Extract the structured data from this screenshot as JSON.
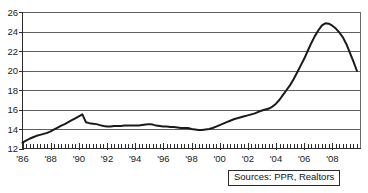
{
  "chart_data": {
    "type": "line",
    "title": "",
    "xlabel": "",
    "ylabel": "",
    "ylim": [
      12,
      26
    ],
    "xlim": [
      1986,
      2010
    ],
    "ytick_step": 2,
    "grid": true,
    "grid_axis": "y",
    "legend": "none",
    "line_color": "#1a1a1a",
    "minor_ticks": "quarterly",
    "yticks": [
      12,
      14,
      16,
      18,
      20,
      22,
      24,
      26
    ],
    "ytick_labels": [
      "12",
      "14",
      "16",
      "18",
      "20",
      "22",
      "24",
      "26"
    ],
    "xticks": [
      1986,
      1988,
      1990,
      1992,
      1994,
      1996,
      1998,
      2000,
      2002,
      2004,
      2006,
      2008
    ],
    "xtick_labels": [
      "'86",
      "'88",
      "'90",
      "'92",
      "'94",
      "'96",
      "'98",
      "'00",
      "'02",
      "'04",
      "'06",
      "'08"
    ],
    "series": [
      {
        "name": "value",
        "x": [
          1986.0,
          1986.25,
          1986.5,
          1986.75,
          1987.0,
          1987.25,
          1987.5,
          1987.75,
          1988.0,
          1988.25,
          1988.5,
          1988.75,
          1989.0,
          1989.25,
          1989.5,
          1989.75,
          1990.0,
          1990.25,
          1990.5,
          1990.75,
          1991.0,
          1991.25,
          1991.5,
          1991.75,
          1992.0,
          1992.25,
          1992.5,
          1992.75,
          1993.0,
          1993.25,
          1993.5,
          1993.75,
          1994.0,
          1994.25,
          1994.5,
          1994.75,
          1995.0,
          1995.25,
          1995.5,
          1995.75,
          1996.0,
          1996.25,
          1996.5,
          1996.75,
          1997.0,
          1997.25,
          1997.5,
          1997.75,
          1998.0,
          1998.25,
          1998.5,
          1998.75,
          1999.0,
          1999.25,
          1999.5,
          1999.75,
          2000.0,
          2000.25,
          2000.5,
          2000.75,
          2001.0,
          2001.25,
          2001.5,
          2001.75,
          2002.0,
          2002.25,
          2002.5,
          2002.75,
          2003.0,
          2003.25,
          2003.5,
          2003.75,
          2004.0,
          2004.25,
          2004.5,
          2004.75,
          2005.0,
          2005.25,
          2005.5,
          2005.75,
          2006.0,
          2006.25,
          2006.5,
          2006.75,
          2007.0,
          2007.25,
          2007.5,
          2007.75,
          2008.0,
          2008.25,
          2008.5,
          2008.75,
          2009.0,
          2009.25,
          2009.5,
          2009.75
        ],
        "values": [
          12.6,
          12.8,
          13.0,
          13.15,
          13.3,
          13.4,
          13.5,
          13.6,
          13.75,
          13.95,
          14.15,
          14.35,
          14.5,
          14.7,
          14.9,
          15.1,
          15.3,
          15.5,
          14.7,
          14.6,
          14.55,
          14.5,
          14.4,
          14.3,
          14.25,
          14.25,
          14.3,
          14.3,
          14.3,
          14.35,
          14.35,
          14.35,
          14.35,
          14.35,
          14.4,
          14.45,
          14.5,
          14.45,
          14.35,
          14.3,
          14.25,
          14.25,
          14.2,
          14.2,
          14.15,
          14.1,
          14.1,
          14.1,
          14.0,
          13.95,
          13.9,
          13.9,
          13.95,
          14.0,
          14.1,
          14.25,
          14.4,
          14.55,
          14.7,
          14.85,
          15.0,
          15.1,
          15.2,
          15.3,
          15.4,
          15.5,
          15.6,
          15.75,
          15.9,
          16.0,
          16.1,
          16.3,
          16.6,
          17.0,
          17.5,
          18.0,
          18.5,
          19.1,
          19.8,
          20.5,
          21.2,
          22.0,
          22.8,
          23.5,
          24.1,
          24.6,
          24.85,
          24.8,
          24.6,
          24.3,
          23.9,
          23.4,
          22.7,
          21.8,
          20.9,
          19.95
        ]
      }
    ]
  },
  "source_note": {
    "text": "Sources:  PPR, Realtors"
  }
}
